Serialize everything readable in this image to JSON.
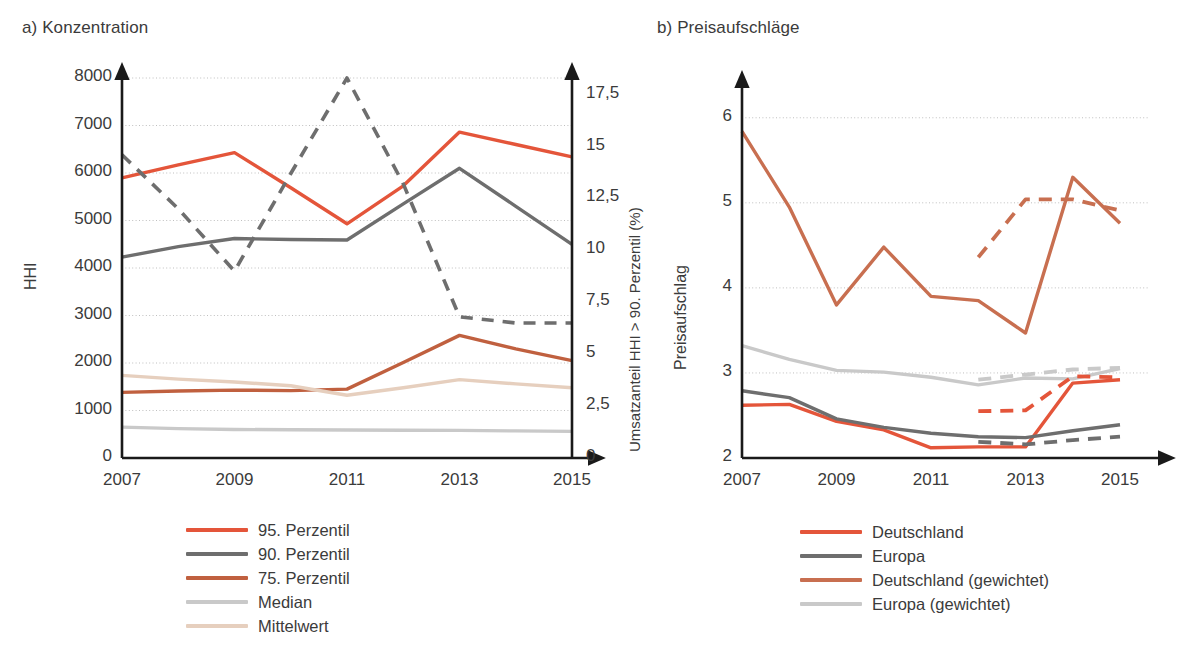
{
  "figure": {
    "panel_a_title": "a) Konzentration",
    "panel_b_title": "b) Preisaufschläge"
  },
  "colors": {
    "red_95": "#E4553A",
    "gray_90": "#6E6E6E",
    "orange_75": "#C0603F",
    "light_gray_median": "#C9C9C9",
    "tan_mean": "#E6CFBE",
    "axis": "#1a1a1a",
    "grid": "#BFBFBF",
    "text": "#3b3b3b",
    "b_red": "#E4553A",
    "b_gray": "#6E6E6E",
    "b_orange": "#C86F50",
    "b_light_gray": "#C9C9C9"
  },
  "chart_data": [
    {
      "type": "line",
      "title": "a) Konzentration",
      "xlabel": "",
      "ylabel": "HHI",
      "y2label": "Umsatzanteil HHI > 90. Perzentil (%)",
      "x": [
        2007,
        2008,
        2009,
        2010,
        2011,
        2012,
        2013,
        2014,
        2015
      ],
      "xticklabels": [
        "2007",
        "2009",
        "2011",
        "2013",
        "2015"
      ],
      "xtickvalues": [
        2007,
        2009,
        2011,
        2013,
        2015
      ],
      "ylim": [
        0,
        8000
      ],
      "yticklabels": [
        "0",
        "1000",
        "2000",
        "3000",
        "4000",
        "5000",
        "6000",
        "7000",
        "8000"
      ],
      "ytickvalues": [
        0,
        1000,
        2000,
        3000,
        4000,
        5000,
        6000,
        7000,
        8000
      ],
      "y2lim": [
        0,
        18.3
      ],
      "y2ticklabels": [
        "0",
        "2,5",
        "5",
        "7,5",
        "10",
        "12,5",
        "15",
        "17,5"
      ],
      "y2tickvalues": [
        0,
        2.5,
        5,
        7.5,
        10,
        12.5,
        15,
        17.5
      ],
      "grid": true,
      "legend_position": "below",
      "series": [
        {
          "name": "95. Perzentil",
          "color": "#E4553A",
          "style": "solid",
          "axis": "left",
          "values": [
            5900,
            6170,
            6430,
            5690,
            4930,
            5730,
            6860,
            6600,
            6340
          ]
        },
        {
          "name": "90. Perzentil",
          "color": "#6E6E6E",
          "style": "solid",
          "axis": "left",
          "values": [
            4230,
            4450,
            4620,
            4600,
            4590,
            5350,
            6100,
            5300,
            4500
          ]
        },
        {
          "name": "75. Perzentil",
          "color": "#C0603F",
          "style": "solid",
          "axis": "left",
          "values": [
            1380,
            1410,
            1430,
            1420,
            1450,
            2010,
            2580,
            2300,
            2050
          ]
        },
        {
          "name": "Median",
          "color": "#C9C9C9",
          "style": "solid",
          "axis": "left",
          "values": [
            650,
            620,
            600,
            595,
            590,
            585,
            580,
            570,
            560
          ]
        },
        {
          "name": "Mittelwert",
          "color": "#E6CFBE",
          "style": "solid",
          "axis": "left",
          "values": [
            1740,
            1660,
            1600,
            1520,
            1320,
            1480,
            1650,
            1560,
            1480
          ]
        },
        {
          "name": "Umsatzanteil HHI > 90. Perzentil (%)",
          "color": "#6E6E6E",
          "style": "dashed",
          "axis": "right",
          "values": [
            14.6,
            12.0,
            9.0,
            13.7,
            18.3,
            13.2,
            6.8,
            6.5,
            6.5
          ]
        }
      ]
    },
    {
      "type": "line",
      "title": "b) Preisaufschläge",
      "xlabel": "",
      "ylabel": "Preisaufschlag",
      "x": [
        2007,
        2008,
        2009,
        2010,
        2011,
        2012,
        2013,
        2014,
        2015
      ],
      "xticklabels": [
        "2007",
        "2009",
        "2011",
        "2013",
        "2015"
      ],
      "xtickvalues": [
        2007,
        2009,
        2011,
        2013,
        2015
      ],
      "ylim": [
        2,
        6.35
      ],
      "yticklabels": [
        "2",
        "3",
        "4",
        "5",
        "6"
      ],
      "ytickvalues": [
        2,
        3,
        4,
        5,
        6
      ],
      "grid": true,
      "legend_position": "below",
      "series": [
        {
          "name": "Deutschland",
          "color": "#E4553A",
          "style": "solid",
          "values": [
            2.62,
            2.63,
            2.43,
            2.33,
            2.12,
            2.13,
            2.13,
            2.88,
            2.92
          ]
        },
        {
          "name": "Europa",
          "color": "#6E6E6E",
          "style": "solid",
          "values": [
            2.79,
            2.71,
            2.46,
            2.36,
            2.29,
            2.25,
            2.24,
            2.32,
            2.39
          ]
        },
        {
          "name": "Deutschland (gewichtet)",
          "color": "#C86F50",
          "style": "solid",
          "values": [
            5.84,
            4.95,
            3.8,
            4.48,
            3.9,
            3.85,
            3.47,
            5.3,
            4.76
          ]
        },
        {
          "name": "Europa (gewichtet)",
          "color": "#C9C9C9",
          "style": "solid",
          "values": [
            3.32,
            3.16,
            3.03,
            3.01,
            2.95,
            2.86,
            2.94,
            2.93,
            3.05
          ]
        },
        {
          "name": "Deutschland (dashed)",
          "color": "#E4553A",
          "style": "dashed",
          "values": [
            null,
            null,
            null,
            null,
            null,
            2.55,
            2.56,
            2.96,
            2.95
          ]
        },
        {
          "name": "Europa (dashed)",
          "color": "#6E6E6E",
          "style": "dashed",
          "values": [
            null,
            null,
            null,
            null,
            null,
            2.19,
            2.16,
            2.21,
            2.25
          ]
        },
        {
          "name": "Deutschland (gewichtet, dashed)",
          "color": "#C86F50",
          "style": "dashed",
          "values": [
            null,
            null,
            null,
            null,
            null,
            4.36,
            5.04,
            5.04,
            4.91
          ]
        },
        {
          "name": "Europa (gewichtet, dashed)",
          "color": "#C9C9C9",
          "style": "dashed",
          "values": [
            null,
            null,
            null,
            null,
            null,
            2.92,
            2.98,
            3.04,
            3.06
          ]
        }
      ]
    }
  ],
  "legend_a": {
    "items": [
      {
        "label": "95. Perzentil",
        "color": "#E4553A"
      },
      {
        "label": "90. Perzentil",
        "color": "#6E6E6E"
      },
      {
        "label": "75. Perzentil",
        "color": "#C0603F"
      },
      {
        "label": "Median",
        "color": "#C9C9C9"
      },
      {
        "label": "Mittelwert",
        "color": "#E6CFBE"
      }
    ]
  },
  "legend_b": {
    "items": [
      {
        "label": "Deutschland",
        "color": "#E4553A"
      },
      {
        "label": "Europa",
        "color": "#6E6E6E"
      },
      {
        "label": "Deutschland (gewichtet)",
        "color": "#C86F50"
      },
      {
        "label": "Europa (gewichtet)",
        "color": "#C9C9C9"
      }
    ]
  }
}
